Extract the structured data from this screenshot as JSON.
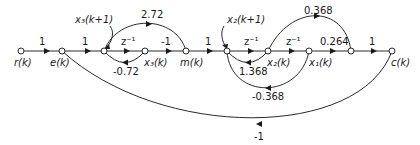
{
  "diagram": {
    "type": "signal-flow-graph",
    "nodes": {
      "r": "r(k)",
      "e": "e(k)",
      "x3_next": "x3(k+1)",
      "x3": "x3(k)",
      "m": "m(k)",
      "x2_next": "x2(k+1)",
      "x2": "x2(k)",
      "x1": "x1(k)",
      "c": "c(k)"
    },
    "labels": {
      "r": "r(k)",
      "e": "e(k)",
      "x3_next": "x₃(k+1)",
      "x3": "x₃(k)",
      "m": "m(k)",
      "x2_next": "x₂(k+1)",
      "x2": "x₂(k)",
      "x1": "x₁(k)",
      "c": "c(k)"
    },
    "gains": {
      "r_e": "1",
      "e_n1": "1",
      "n1_x3": "z⁻¹",
      "x3_n1": "-0.72",
      "n1_m": "2.72",
      "x3_m": "-1",
      "m_n2": "1",
      "n2_x2": "z⁻¹",
      "x2_n2": "1.368",
      "x2_x1": "z⁻¹",
      "x1_n2": "-0.368",
      "x2_n3": "0.368",
      "x1_n3": "0.264",
      "n3_c": "1",
      "c_e": "-1"
    }
  }
}
